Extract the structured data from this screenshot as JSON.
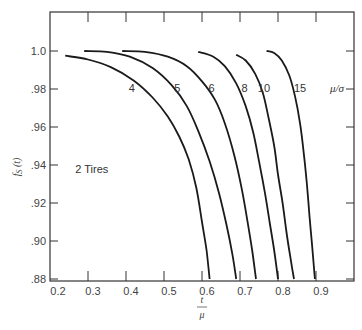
{
  "chart_data": {
    "type": "line",
    "title": "",
    "xlabel": "t/μ",
    "ylabel": "fs (t)",
    "xlim": [
      0.2,
      1.0
    ],
    "ylim": [
      0.88,
      1.02
    ],
    "x_ticks": [
      0.2,
      0.3,
      0.4,
      0.5,
      0.6,
      0.7,
      0.8,
      0.9
    ],
    "x_tick_labels": [
      "0.2",
      "0.3",
      "0.4",
      "0.5",
      "0.6",
      "0.7",
      "0.8",
      "0.9"
    ],
    "y_ticks": [
      1.0,
      0.98,
      0.96,
      0.94,
      0.92,
      0.9,
      0.88
    ],
    "y_tick_labels": [
      "1.0",
      ".98",
      ".96",
      ".94",
      ".92",
      ".90",
      ".88"
    ],
    "grid": false,
    "annotations": [
      {
        "text": "2 Tires",
        "x": 0.31,
        "y": 0.938
      },
      {
        "text": "μ/σ",
        "x": 0.955,
        "y": 0.9805
      }
    ],
    "legend_title": "μ/σ",
    "series": [
      {
        "name": "4",
        "label_pos": [
          0.415,
          0.9805
        ],
        "points": [
          [
            0.24,
            0.9975
          ],
          [
            0.3,
            0.9955
          ],
          [
            0.36,
            0.9915
          ],
          [
            0.42,
            0.9845
          ],
          [
            0.47,
            0.9755
          ],
          [
            0.51,
            0.9655
          ],
          [
            0.54,
            0.955
          ],
          [
            0.565,
            0.943
          ],
          [
            0.585,
            0.928
          ],
          [
            0.6,
            0.91
          ],
          [
            0.612,
            0.895
          ],
          [
            0.62,
            0.88
          ]
        ]
      },
      {
        "name": "5",
        "label_pos": [
          0.535,
          0.9805
        ],
        "points": [
          [
            0.29,
            1.0
          ],
          [
            0.35,
            0.9995
          ],
          [
            0.41,
            0.997
          ],
          [
            0.47,
            0.991
          ],
          [
            0.52,
            0.982
          ],
          [
            0.56,
            0.971
          ],
          [
            0.59,
            0.958
          ],
          [
            0.62,
            0.942
          ],
          [
            0.645,
            0.925
          ],
          [
            0.665,
            0.908
          ],
          [
            0.68,
            0.893
          ],
          [
            0.69,
            0.88
          ]
        ]
      },
      {
        "name": "6",
        "label_pos": [
          0.625,
          0.9805
        ],
        "points": [
          [
            0.39,
            1.0
          ],
          [
            0.45,
            0.9995
          ],
          [
            0.51,
            0.997
          ],
          [
            0.56,
            0.992
          ],
          [
            0.6,
            0.984
          ],
          [
            0.635,
            0.974
          ],
          [
            0.66,
            0.962
          ],
          [
            0.685,
            0.945
          ],
          [
            0.705,
            0.927
          ],
          [
            0.72,
            0.91
          ],
          [
            0.732,
            0.895
          ],
          [
            0.742,
            0.88
          ]
        ]
      },
      {
        "name": "8",
        "label_pos": [
          0.712,
          0.9805
        ],
        "points": [
          [
            0.59,
            0.9995
          ],
          [
            0.63,
            0.997
          ],
          [
            0.66,
            0.992
          ],
          [
            0.69,
            0.983
          ],
          [
            0.715,
            0.971
          ],
          [
            0.735,
            0.957
          ],
          [
            0.75,
            0.942
          ],
          [
            0.765,
            0.926
          ],
          [
            0.778,
            0.91
          ],
          [
            0.79,
            0.895
          ],
          [
            0.8,
            0.88
          ]
        ]
      },
      {
        "name": "10",
        "label_pos": [
          0.763,
          0.9805
        ],
        "points": [
          [
            0.69,
            0.998
          ],
          [
            0.715,
            0.995
          ],
          [
            0.74,
            0.988
          ],
          [
            0.76,
            0.978
          ],
          [
            0.775,
            0.965
          ],
          [
            0.79,
            0.95
          ],
          [
            0.8,
            0.935
          ],
          [
            0.812,
            0.92
          ],
          [
            0.822,
            0.905
          ],
          [
            0.832,
            0.892
          ],
          [
            0.842,
            0.88
          ]
        ]
      },
      {
        "name": "15",
        "label_pos": [
          0.858,
          0.9805
        ],
        "points": [
          [
            0.77,
            1.0
          ],
          [
            0.79,
            0.999
          ],
          [
            0.81,
            0.995
          ],
          [
            0.83,
            0.987
          ],
          [
            0.845,
            0.976
          ],
          [
            0.858,
            0.962
          ],
          [
            0.868,
            0.946
          ],
          [
            0.876,
            0.93
          ],
          [
            0.883,
            0.913
          ],
          [
            0.89,
            0.897
          ],
          [
            0.897,
            0.88
          ]
        ]
      }
    ]
  }
}
